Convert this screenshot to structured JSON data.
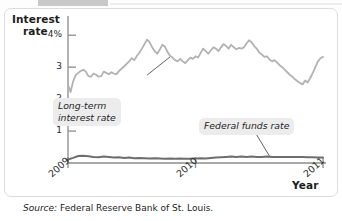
{
  "figure": {
    "y_axis_title_line1": "Interest",
    "y_axis_title_line2": "rate",
    "x_axis_title": "Year",
    "source_label": "Source:",
    "source_text": " Federal Reserve Bank of St. Louis.",
    "callouts": {
      "long_term": "Long-term\ninterest rate",
      "federal_funds": "Federal funds rate"
    },
    "colors": {
      "long_term_line": "#b2b2b2",
      "federal_funds_line": "#6e6e6e",
      "axis": "#8c8c8c",
      "callout_background": "#ececed",
      "card_border": "#dcdcdc",
      "text": "#1c1c1c"
    }
  },
  "chart_data": {
    "type": "line",
    "title": "",
    "subtitle": "",
    "xlabel": "Year",
    "ylabel": "Interest rate",
    "grid": false,
    "legend": "annotations",
    "xlim": [
      2009.0,
      2011.0
    ],
    "ylim": [
      0,
      4.35
    ],
    "yticks": [
      1,
      2,
      3,
      4
    ],
    "ytick_labels": [
      "1",
      "2",
      "3",
      "4%"
    ],
    "xticks": [
      2009,
      2010,
      2011
    ],
    "xtick_labels": [
      "2009",
      "2010",
      "2011"
    ],
    "series": [
      {
        "name": "Long-term interest rate",
        "color": "#b2b2b2",
        "x": [
          2009.0,
          2009.02,
          2009.04,
          2009.06,
          2009.08,
          2009.1,
          2009.12,
          2009.14,
          2009.16,
          2009.18,
          2009.2,
          2009.22,
          2009.24,
          2009.26,
          2009.28,
          2009.3,
          2009.32,
          2009.34,
          2009.36,
          2009.38,
          2009.4,
          2009.42,
          2009.44,
          2009.46,
          2009.48,
          2009.5,
          2009.52,
          2009.54,
          2009.56,
          2009.58,
          2009.6,
          2009.62,
          2009.64,
          2009.66,
          2009.68,
          2009.7,
          2009.72,
          2009.74,
          2009.76,
          2009.78,
          2009.8,
          2009.82,
          2009.84,
          2009.86,
          2009.88,
          2009.9,
          2009.92,
          2009.94,
          2009.96,
          2009.98,
          2010.0,
          2010.02,
          2010.04,
          2010.06,
          2010.08,
          2010.1,
          2010.12,
          2010.14,
          2010.16,
          2010.18,
          2010.2,
          2010.22,
          2010.24,
          2010.26,
          2010.28,
          2010.3,
          2010.32,
          2010.34,
          2010.36,
          2010.38,
          2010.4,
          2010.42,
          2010.44,
          2010.46,
          2010.48,
          2010.5,
          2010.52,
          2010.54,
          2010.56,
          2010.58,
          2010.6,
          2010.62,
          2010.64,
          2010.66,
          2010.68,
          2010.7,
          2010.72,
          2010.74,
          2010.76,
          2010.78,
          2010.8,
          2010.82,
          2010.84,
          2010.86,
          2010.88,
          2010.9,
          2010.92,
          2010.94,
          2010.96,
          2010.98,
          2011.0
        ],
        "y": [
          2.45,
          2.22,
          2.55,
          2.75,
          2.82,
          2.88,
          2.92,
          2.86,
          2.72,
          2.7,
          2.8,
          2.76,
          2.7,
          2.72,
          2.86,
          2.82,
          2.78,
          2.84,
          2.8,
          2.78,
          2.88,
          2.95,
          3.02,
          3.1,
          3.18,
          3.28,
          3.22,
          3.35,
          3.45,
          3.58,
          3.72,
          3.86,
          3.78,
          3.62,
          3.5,
          3.42,
          3.55,
          3.7,
          3.64,
          3.48,
          3.36,
          3.3,
          3.22,
          3.18,
          3.26,
          3.18,
          3.12,
          3.22,
          3.3,
          3.26,
          3.34,
          3.3,
          3.44,
          3.58,
          3.5,
          3.42,
          3.52,
          3.62,
          3.58,
          3.5,
          3.62,
          3.72,
          3.66,
          3.58,
          3.7,
          3.62,
          3.56,
          3.6,
          3.58,
          3.62,
          3.74,
          3.84,
          3.78,
          3.66,
          3.58,
          3.46,
          3.4,
          3.32,
          3.34,
          3.24,
          3.18,
          3.22,
          3.14,
          3.06,
          3.0,
          2.92,
          2.84,
          2.76,
          2.7,
          2.62,
          2.56,
          2.5,
          2.46,
          2.58,
          2.52,
          2.66,
          2.82,
          3.0,
          3.18,
          3.28,
          3.32
        ]
      },
      {
        "name": "Federal funds rate",
        "color": "#6e6e6e",
        "x": [
          2009.0,
          2009.04,
          2009.08,
          2009.12,
          2009.16,
          2009.2,
          2009.24,
          2009.28,
          2009.32,
          2009.36,
          2009.4,
          2009.44,
          2009.48,
          2009.52,
          2009.56,
          2009.6,
          2009.64,
          2009.68,
          2009.72,
          2009.76,
          2009.8,
          2009.84,
          2009.88,
          2009.92,
          2009.96,
          2010.0,
          2010.04,
          2010.08,
          2010.12,
          2010.16,
          2010.2,
          2010.24,
          2010.28,
          2010.32,
          2010.36,
          2010.4,
          2010.44,
          2010.48,
          2010.52,
          2010.56,
          2010.6,
          2010.64,
          2010.68,
          2010.72,
          2010.76,
          2010.8,
          2010.84,
          2010.88,
          2010.92,
          2010.96,
          2011.0
        ],
        "y": [
          0.11,
          0.16,
          0.22,
          0.23,
          0.21,
          0.19,
          0.18,
          0.2,
          0.19,
          0.17,
          0.18,
          0.16,
          0.17,
          0.15,
          0.16,
          0.15,
          0.14,
          0.15,
          0.14,
          0.13,
          0.14,
          0.13,
          0.14,
          0.13,
          0.13,
          0.14,
          0.15,
          0.14,
          0.16,
          0.17,
          0.18,
          0.19,
          0.2,
          0.19,
          0.2,
          0.19,
          0.2,
          0.19,
          0.19,
          0.2,
          0.19,
          0.19,
          0.19,
          0.19,
          0.19,
          0.19,
          0.19,
          0.18,
          0.18,
          0.17,
          0.17
        ]
      }
    ],
    "annotations": [
      {
        "text": "Long-term interest rate",
        "leader_from": [
          2009.62,
          2.75
        ],
        "leader_to": [
          2009.8,
          3.32
        ]
      },
      {
        "text": "Federal funds rate",
        "leader_from": [
          2010.48,
          0.88
        ],
        "leader_to": [
          2010.58,
          0.22
        ]
      }
    ]
  }
}
